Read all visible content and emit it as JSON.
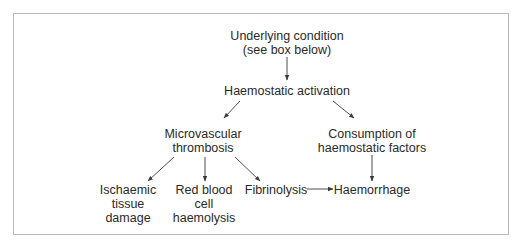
{
  "diagram": {
    "type": "flowchart",
    "nodes": {
      "underlying_condition": {
        "line1": "Underlying condition",
        "line2": "(see box below)"
      },
      "haemostatic_activation": {
        "line1": "Haemostatic activation"
      },
      "microvascular_thrombosis": {
        "line1": "Microvascular",
        "line2": "thrombosis"
      },
      "consumption": {
        "line1": "Consumption of",
        "line2": "haemostatic factors"
      },
      "ischaemic": {
        "line1": "Ischaemic",
        "line2": "tissue",
        "line3": "damage"
      },
      "rbc_haemolysis": {
        "line1": "Red blood",
        "line2": "cell",
        "line3": "haemolysis"
      },
      "fibrinolysis": {
        "line1": "Fibrinolysis"
      },
      "haemorrhage": {
        "line1": "Haemorrhage"
      }
    },
    "edges": [
      {
        "from": "underlying_condition",
        "to": "haemostatic_activation"
      },
      {
        "from": "haemostatic_activation",
        "to": "microvascular_thrombosis"
      },
      {
        "from": "haemostatic_activation",
        "to": "consumption"
      },
      {
        "from": "microvascular_thrombosis",
        "to": "ischaemic"
      },
      {
        "from": "microvascular_thrombosis",
        "to": "rbc_haemolysis"
      },
      {
        "from": "microvascular_thrombosis",
        "to": "fibrinolysis"
      },
      {
        "from": "consumption",
        "to": "haemorrhage"
      },
      {
        "from": "fibrinolysis",
        "to": "haemorrhage"
      }
    ],
    "colors": {
      "text": "#2a2a2a",
      "arrow": "#3a3a3a",
      "frame": "#b8b8b8"
    }
  }
}
